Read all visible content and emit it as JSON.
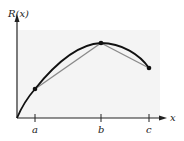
{
  "diagram": {
    "y_axis_label": "R(x)",
    "x_axis_label": "x",
    "ticks": [
      {
        "label": "a",
        "x": 35
      },
      {
        "label": "b",
        "x": 101
      },
      {
        "label": "c",
        "x": 149
      }
    ],
    "points": [
      {
        "name": "A",
        "x": 35,
        "y": 89
      },
      {
        "name": "B",
        "x": 101,
        "y": 43
      },
      {
        "name": "C",
        "x": 149,
        "y": 68
      }
    ],
    "colors": {
      "curve": "#111111",
      "secant": "#8a8a8a",
      "axis": "#222222",
      "shade": "#f3f3f3"
    }
  }
}
